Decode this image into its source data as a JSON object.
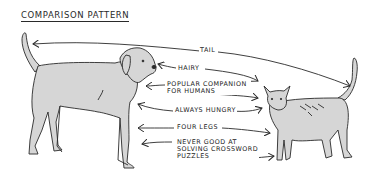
{
  "title": "COMPARISON PATTERN",
  "left_subject": "dog",
  "right_subject": "cat",
  "labels": [
    {
      "text": "TAIL"
    },
    {
      "text": "HAIRY"
    },
    {
      "text": "POPULAR COMPANION\nFOR HUMANS"
    },
    {
      "text": "ALWAYS HUNGRY"
    },
    {
      "text": "FOUR LEGS"
    },
    {
      "text": "NEVER GOOD AT\nSOLVING CROSSWORD\nPUZZLES"
    }
  ],
  "colors": {
    "ink": "#2a2a2a",
    "fill": "#d6d6d6",
    "background": "#ffffff"
  }
}
